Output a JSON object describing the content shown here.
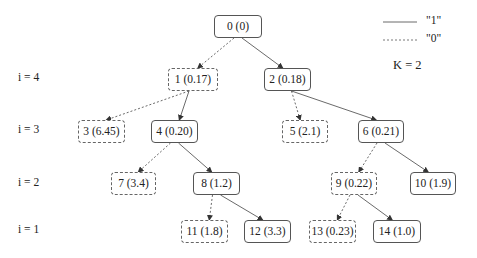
{
  "legend": {
    "solid_label": "\"1\"",
    "dashed_label": "\"0\"",
    "k_label": "K = 2"
  },
  "levels": [
    {
      "label": "i = 4",
      "y": 79
    },
    {
      "label": "i = 3",
      "y": 131
    },
    {
      "label": "i = 2",
      "y": 184
    },
    {
      "label": "i = 1",
      "y": 231
    }
  ],
  "nodes": [
    {
      "id": 0,
      "label": "0 (0)",
      "x": 214,
      "y": 15,
      "w": 48,
      "style": "solid"
    },
    {
      "id": 1,
      "label": "1 (0.17)",
      "x": 168,
      "y": 68,
      "w": 50,
      "style": "dashed"
    },
    {
      "id": 2,
      "label": "2 (0.18)",
      "x": 264,
      "y": 68,
      "w": 47,
      "style": "solid"
    },
    {
      "id": 3,
      "label": "3 (6.45)",
      "x": 78,
      "y": 120,
      "w": 47,
      "style": "dashed"
    },
    {
      "id": 4,
      "label": "4 (0.20)",
      "x": 151,
      "y": 120,
      "w": 47,
      "style": "solid"
    },
    {
      "id": 5,
      "label": "5 (2.1)",
      "x": 282,
      "y": 120,
      "w": 46,
      "style": "dashed"
    },
    {
      "id": 6,
      "label": "6 (0.21)",
      "x": 358,
      "y": 120,
      "w": 46,
      "style": "solid"
    },
    {
      "id": 7,
      "label": "7 (3.4)",
      "x": 111,
      "y": 172,
      "w": 45,
      "style": "dashed"
    },
    {
      "id": 8,
      "label": "8 (1.2)",
      "x": 193,
      "y": 172,
      "w": 47,
      "style": "solid"
    },
    {
      "id": 9,
      "label": "9 (0.22)",
      "x": 331,
      "y": 172,
      "w": 46,
      "style": "dashed"
    },
    {
      "id": 10,
      "label": "10 (1.9)",
      "x": 410,
      "y": 172,
      "w": 46,
      "style": "solid"
    },
    {
      "id": 11,
      "label": "11 (1.8)",
      "x": 181,
      "y": 220,
      "w": 47,
      "style": "dashed"
    },
    {
      "id": 12,
      "label": "12 (3.3)",
      "x": 244,
      "y": 220,
      "w": 47,
      "style": "solid"
    },
    {
      "id": 13,
      "label": "13 (0.23)",
      "x": 309,
      "y": 220,
      "w": 47,
      "style": "dashed"
    },
    {
      "id": 14,
      "label": "14 (1.0)",
      "x": 373,
      "y": 220,
      "w": 48,
      "style": "solid"
    }
  ],
  "edges": [
    {
      "from": 0,
      "to": 1,
      "type": "0"
    },
    {
      "from": 0,
      "to": 2,
      "type": "1"
    },
    {
      "from": 1,
      "to": 3,
      "type": "0"
    },
    {
      "from": 1,
      "to": 4,
      "type": "1"
    },
    {
      "from": 2,
      "to": 5,
      "type": "0"
    },
    {
      "from": 2,
      "to": 6,
      "type": "1"
    },
    {
      "from": 4,
      "to": 7,
      "type": "0"
    },
    {
      "from": 4,
      "to": 8,
      "type": "1"
    },
    {
      "from": 6,
      "to": 9,
      "type": "0"
    },
    {
      "from": 6,
      "to": 10,
      "type": "1"
    },
    {
      "from": 8,
      "to": 11,
      "type": "0"
    },
    {
      "from": 8,
      "to": 12,
      "type": "1"
    },
    {
      "from": 9,
      "to": 13,
      "type": "0"
    },
    {
      "from": 9,
      "to": 14,
      "type": "1"
    }
  ]
}
